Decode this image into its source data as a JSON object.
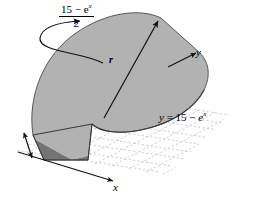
{
  "figure": {
    "type": "math-diagram",
    "colors": {
      "top_face": "#b2b2b2",
      "front_face": "#747474",
      "outline": "#1a1a1a",
      "grid": "#bdbdbd",
      "background": "#ffffff"
    }
  },
  "labels": {
    "radius_fraction": {
      "numerator_prefix": "15",
      "numerator_minus": "−",
      "numerator_base": "e",
      "numerator_exponent": "x",
      "numerator_plain": "15 − e",
      "denominator": "2",
      "full_text": "(15 − e^x)/2"
    },
    "radius_marker": "r",
    "axis_y": "y",
    "axis_x": "x",
    "curve_equation": {
      "lhs": "y",
      "equals": "=",
      "rhs_prefix": "15",
      "rhs_minus": "−",
      "rhs_base": "e",
      "rhs_exponent": "x",
      "full_text": "y = 15 − e^x"
    }
  },
  "annotations": {
    "leader_arrow": "curved-leader-from-fraction-to-radius",
    "dimension_arrow": "left-height-double-arrow",
    "radius_arrow": "radius-line-with-arrowhead"
  }
}
